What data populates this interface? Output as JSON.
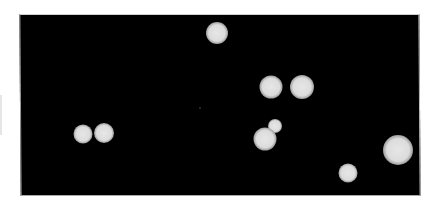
{
  "image": {
    "width": 439,
    "height": 209,
    "background_color": "#ffffff",
    "field_color": "#000000",
    "particle_color": "#e2e2e2",
    "particle_edge_color": "#bdbdbd",
    "field": {
      "left": 20,
      "top": 14,
      "right": 420,
      "bottom": 196
    },
    "particles": [
      {
        "cx": 217,
        "cy": 33,
        "r": 11
      },
      {
        "cx": 271,
        "cy": 87,
        "r": 11.5
      },
      {
        "cx": 302,
        "cy": 87,
        "r": 12
      },
      {
        "cx": 83,
        "cy": 134,
        "r": 9.5
      },
      {
        "cx": 104,
        "cy": 133,
        "r": 10
      },
      {
        "cx": 275,
        "cy": 126,
        "r": 7
      },
      {
        "cx": 265,
        "cy": 139,
        "r": 11.5
      },
      {
        "cx": 398,
        "cy": 150,
        "r": 15
      },
      {
        "cx": 348,
        "cy": 173,
        "r": 9.5
      }
    ],
    "faint_dots": [
      {
        "cx": 200,
        "cy": 108,
        "r": 1
      }
    ]
  }
}
